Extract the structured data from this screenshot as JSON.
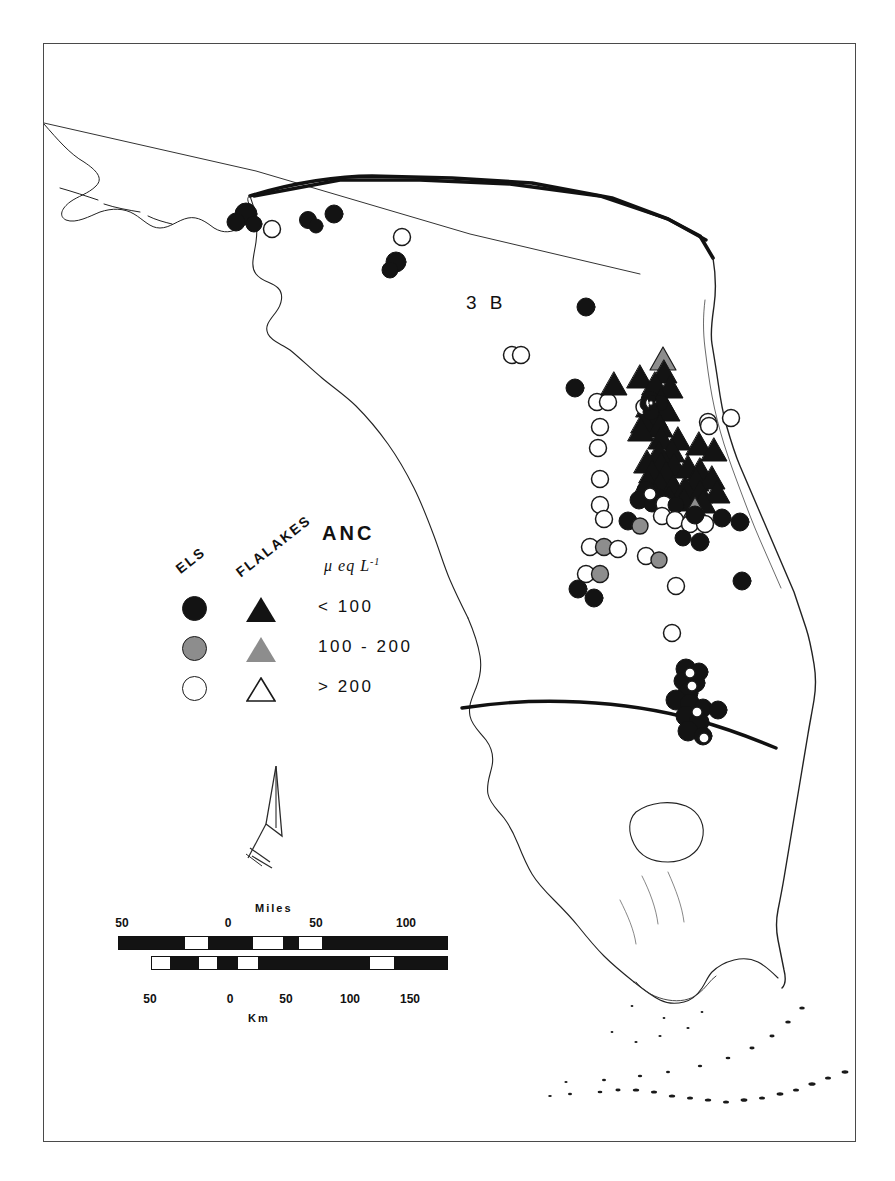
{
  "figure": {
    "label": "3 B",
    "caption_fragment": ""
  },
  "legend": {
    "col_headers": {
      "els": "ELS",
      "flalakes": "FLALAKES"
    },
    "title": "ANC",
    "units": "μ eq L",
    "units_exponent": "-1",
    "rows": [
      {
        "class_label": "< 100",
        "circle_fill": "#131313",
        "triangle_fill": "#131313",
        "style": "filled-dark"
      },
      {
        "class_label": "100 - 200",
        "circle_fill": "#8d8d8d",
        "triangle_fill": "#8d8d8d",
        "style": "filled-gray"
      },
      {
        "class_label": "> 200",
        "circle_fill": "#ffffff",
        "triangle_fill": "#ffffff",
        "style": "open"
      }
    ]
  },
  "scale": {
    "miles": {
      "title": "Miles",
      "ticks": [
        "50",
        "0",
        "50",
        "100"
      ]
    },
    "km": {
      "title": "Km",
      "ticks": [
        "50",
        "0",
        "50",
        "100",
        "150"
      ]
    }
  },
  "colors": {
    "ink": "#131313",
    "mid_gray": "#8d8d8d",
    "frame": "#4a4a4a",
    "paper": "#ffffff"
  },
  "map_data": {
    "region": "Florida",
    "point_classes": {
      "filled_circle": "ELS lake, ANC < 100",
      "gray_circle": "ELS lake, ANC 100 - 200",
      "open_circle": "ELS lake, ANC > 200",
      "filled_triangle": "FLALAKES lake, ANC < 100",
      "gray_triangle": "FLALAKES lake, ANC 100 - 200",
      "open_triangle": "FLALAKES lake, ANC > 200"
    }
  }
}
